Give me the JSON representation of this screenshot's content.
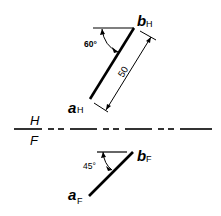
{
  "diagram": {
    "type": "orthographic-projection",
    "top_view": {
      "point_start_label": "a",
      "point_start_sub": "H",
      "point_end_label": "b",
      "point_end_sub": "H",
      "angle_label": "60°",
      "length_label": "50"
    },
    "fold_line": {
      "upper_label": "H",
      "lower_label": "F"
    },
    "front_view": {
      "point_start_label": "a",
      "point_start_sub": "F",
      "point_end_label": "b",
      "point_end_sub": "F",
      "angle_label": "45°"
    },
    "colors": {
      "ink": "#000000",
      "background": "#ffffff"
    }
  }
}
